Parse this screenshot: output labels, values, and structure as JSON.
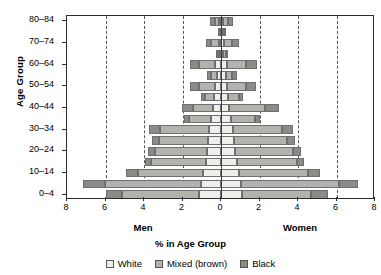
{
  "chart_data": {
    "type": "bar",
    "subtype": "population-pyramid-stacked",
    "title": "",
    "xlabel": "% in Age Group",
    "ylabel": "Age Group",
    "left_side_label": "Men",
    "right_side_label": "Women",
    "xlim": [
      -8,
      8
    ],
    "xticks": [
      8,
      6,
      4,
      2,
      0,
      2,
      4,
      6,
      8
    ],
    "xtick_values": [
      -8,
      -6,
      -4,
      -2,
      0,
      2,
      4,
      6,
      8
    ],
    "gridlines_at": [
      -6,
      -4,
      -2,
      2,
      4,
      6
    ],
    "grid": "vertical-dashed",
    "legend_position": "bottom-center",
    "categories": [
      "0–4",
      "5–9",
      "10–14",
      "15–19",
      "20–24",
      "25–29",
      "30–34",
      "35–39",
      "40–44",
      "45–49",
      "50–54",
      "55–59",
      "60–64",
      "65–69",
      "70–74",
      "75–79",
      "80–84"
    ],
    "ytick_labels": [
      "0–4",
      "10–14",
      "20–24",
      "30–34",
      "40–44",
      "50–54",
      "60–64",
      "70–74",
      "80–84"
    ],
    "series": [
      {
        "name": "White",
        "sex": "Men",
        "values": [
          1.15,
          1.05,
          0.95,
          0.8,
          0.72,
          0.66,
          0.6,
          0.52,
          0.42,
          0.35,
          0.3,
          0.22,
          0.3,
          0.1,
          0.12,
          0.06,
          0.08
        ]
      },
      {
        "name": "Mixed (brown)",
        "sex": "Men",
        "values": [
          4.0,
          5.0,
          3.35,
          2.85,
          2.7,
          2.55,
          2.55,
          1.15,
          1.05,
          0.5,
          0.85,
          0.3,
          0.85,
          0.1,
          0.38,
          0.06,
          0.22
        ]
      },
      {
        "name": "Black",
        "sex": "Men",
        "values": [
          0.85,
          1.1,
          0.65,
          0.3,
          0.35,
          0.35,
          0.6,
          0.25,
          0.55,
          0.2,
          0.45,
          0.2,
          0.45,
          0.05,
          0.3,
          0.04,
          0.25
        ]
      },
      {
        "name": "White",
        "sex": "Women",
        "values": [
          1.1,
          1.05,
          0.95,
          0.82,
          0.75,
          0.7,
          0.62,
          0.52,
          0.44,
          0.36,
          0.32,
          0.24,
          0.32,
          0.12,
          0.14,
          0.07,
          0.1
        ]
      },
      {
        "name": "Mixed (brown)",
        "sex": "Women",
        "values": [
          3.55,
          5.1,
          3.55,
          3.15,
          3.0,
          2.75,
          2.55,
          1.25,
          1.85,
          0.55,
          1.0,
          0.35,
          1.0,
          0.12,
          0.42,
          0.07,
          0.25
        ]
      },
      {
        "name": "Black",
        "sex": "Women",
        "values": [
          0.9,
          0.95,
          0.65,
          0.35,
          0.4,
          0.4,
          0.55,
          0.28,
          0.7,
          0.22,
          0.5,
          0.22,
          0.55,
          0.06,
          0.35,
          0.05,
          0.28
        ]
      }
    ],
    "legend": [
      {
        "label": "White",
        "color": "#eeeeea"
      },
      {
        "label": "Mixed (brown)",
        "color": "#b3b3ad"
      },
      {
        "label": "Black",
        "color": "#8a8a86"
      }
    ]
  },
  "colors": {
    "white_seg": "#eeeeea",
    "mixed_seg": "#b3b3ad",
    "black_seg": "#8a8a86",
    "axis": "#2a2a2a",
    "grid": "#555555"
  }
}
